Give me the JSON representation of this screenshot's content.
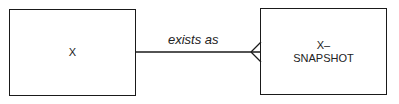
{
  "diagram": {
    "type": "entity-relationship",
    "entities": [
      {
        "id": "e1",
        "label": "X"
      },
      {
        "id": "e2",
        "label_lines": [
          "X–",
          "SNAPSHOT"
        ]
      }
    ],
    "relationship": {
      "from": "e1",
      "to": "e2",
      "label": "exists as",
      "from_cardinality": "one",
      "to_cardinality": "many (crow's foot)"
    }
  }
}
